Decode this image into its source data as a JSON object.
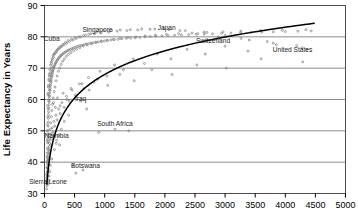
{
  "chart_data": {
    "type": "scatter",
    "title": "",
    "xlabel": "",
    "ylabel": "Life Expectancy in Years",
    "xlim": [
      0,
      5000
    ],
    "ylim": [
      30,
      90
    ],
    "xticks": [
      0,
      500,
      1000,
      1500,
      2000,
      2500,
      3000,
      3500,
      4000,
      4500,
      5000
    ],
    "yticks": [
      30,
      40,
      50,
      60,
      70,
      80,
      90
    ],
    "xtick_labels": [
      "0",
      "500",
      "1000",
      "1500",
      "2000",
      "2500",
      "3000",
      "3500",
      "4000",
      "4500",
      "5000"
    ],
    "ytick_labels": [
      "30",
      "40",
      "50",
      "60",
      "70",
      "80",
      "90"
    ],
    "grid": "horizontal",
    "legend": "none",
    "marker": "open-circle",
    "marker_color": "#808080",
    "trendline": {
      "present": true,
      "shape": "logarithmic",
      "color": "#000000",
      "x_start": 40,
      "x_end": 4480,
      "y_start": 33,
      "y_end": 84.3
    },
    "annotations": [
      {
        "text": "Singapore",
        "x": 880,
        "y": 81.5
      },
      {
        "text": "Japan",
        "x": 2030,
        "y": 82.3
      },
      {
        "text": "Cuba",
        "x": 120,
        "y": 78.6
      },
      {
        "text": "Switzerland",
        "x": 2800,
        "y": 78.0
      },
      {
        "text": "United States",
        "x": 4120,
        "y": 75.2
      },
      {
        "text": "Iraq",
        "x": 600,
        "y": 59.6
      },
      {
        "text": "South Africa",
        "x": 1170,
        "y": 51.6
      },
      {
        "text": "Namibia",
        "x": 200,
        "y": 47.7
      },
      {
        "text": "Botswana",
        "x": 680,
        "y": 38.0
      },
      {
        "text": "Sierra Leone",
        "x": 60,
        "y": 33.1
      }
    ],
    "points": [
      [
        35,
        33.2
      ],
      [
        38,
        35.0
      ],
      [
        40,
        36.3
      ],
      [
        42,
        38.2
      ],
      [
        44,
        40.1
      ],
      [
        46,
        41.5
      ],
      [
        48,
        43.0
      ],
      [
        50,
        44.6
      ],
      [
        52,
        46.2
      ],
      [
        55,
        47.5
      ],
      [
        58,
        48.8
      ],
      [
        60,
        50.2
      ],
      [
        62,
        51.5
      ],
      [
        64,
        52.8
      ],
      [
        66,
        54.0
      ],
      [
        68,
        55.2
      ],
      [
        70,
        56.1
      ],
      [
        72,
        57.3
      ],
      [
        75,
        58.4
      ],
      [
        78,
        59.4
      ],
      [
        80,
        60.3
      ],
      [
        83,
        61.2
      ],
      [
        86,
        62.0
      ],
      [
        90,
        62.9
      ],
      [
        94,
        63.6
      ],
      [
        98,
        64.4
      ],
      [
        102,
        65.1
      ],
      [
        106,
        65.7
      ],
      [
        110,
        66.4
      ],
      [
        115,
        67.0
      ],
      [
        120,
        67.6
      ],
      [
        126,
        68.1
      ],
      [
        132,
        68.6
      ],
      [
        138,
        69.1
      ],
      [
        145,
        69.6
      ],
      [
        152,
        70.0
      ],
      [
        160,
        70.5
      ],
      [
        168,
        70.9
      ],
      [
        176,
        71.3
      ],
      [
        185,
        71.7
      ],
      [
        195,
        72.0
      ],
      [
        205,
        72.4
      ],
      [
        216,
        72.7
      ],
      [
        228,
        73.0
      ],
      [
        240,
        73.3
      ],
      [
        253,
        73.6
      ],
      [
        267,
        73.9
      ],
      [
        282,
        74.2
      ],
      [
        297,
        74.4
      ],
      [
        313,
        74.7
      ],
      [
        330,
        74.9
      ],
      [
        348,
        75.2
      ],
      [
        367,
        75.4
      ],
      [
        387,
        75.6
      ],
      [
        408,
        75.8
      ],
      [
        430,
        76.0
      ],
      [
        453,
        76.2
      ],
      [
        478,
        76.4
      ],
      [
        504,
        76.6
      ],
      [
        531,
        76.8
      ],
      [
        560,
        77.0
      ],
      [
        590,
        77.2
      ],
      [
        622,
        77.3
      ],
      [
        655,
        77.5
      ],
      [
        690,
        77.7
      ],
      [
        727,
        77.8
      ],
      [
        766,
        78.0
      ],
      [
        807,
        78.1
      ],
      [
        850,
        78.3
      ],
      [
        895,
        78.4
      ],
      [
        943,
        78.6
      ],
      [
        993,
        78.7
      ],
      [
        1046,
        78.8
      ],
      [
        1102,
        79.0
      ],
      [
        1161,
        79.1
      ],
      [
        1223,
        79.2
      ],
      [
        1288,
        79.4
      ],
      [
        1357,
        79.5
      ],
      [
        1429,
        79.6
      ],
      [
        1505,
        79.7
      ],
      [
        1585,
        79.8
      ],
      [
        1669,
        80.0
      ],
      [
        1758,
        80.1
      ],
      [
        1851,
        80.2
      ],
      [
        1949,
        80.3
      ],
      [
        2052,
        80.4
      ],
      [
        2161,
        80.5
      ],
      [
        2275,
        80.6
      ],
      [
        2395,
        80.7
      ],
      [
        2521,
        80.8
      ],
      [
        2654,
        80.9
      ],
      [
        2794,
        81.0
      ],
      [
        2941,
        81.1
      ],
      [
        3096,
        81.2
      ],
      [
        3259,
        81.3
      ],
      [
        3430,
        81.4
      ],
      [
        3610,
        81.5
      ],
      [
        3800,
        81.6
      ],
      [
        4000,
        81.7
      ],
      [
        4210,
        81.8
      ],
      [
        4430,
        81.9
      ],
      [
        45,
        42.0
      ],
      [
        52,
        40.5
      ],
      [
        58,
        44.0
      ],
      [
        63,
        46.5
      ],
      [
        70,
        49.0
      ],
      [
        48,
        52.0
      ],
      [
        55,
        54.5
      ],
      [
        62,
        57.0
      ],
      [
        70,
        59.5
      ],
      [
        78,
        61.0
      ],
      [
        85,
        63.0
      ],
      [
        95,
        64.5
      ],
      [
        105,
        66.0
      ],
      [
        118,
        67.5
      ],
      [
        130,
        69.0
      ],
      [
        145,
        70.5
      ],
      [
        40,
        47.0
      ],
      [
        44,
        50.0
      ],
      [
        50,
        58.0
      ],
      [
        56,
        61.5
      ],
      [
        64,
        64.0
      ],
      [
        72,
        66.5
      ],
      [
        80,
        68.0
      ],
      [
        90,
        69.5
      ],
      [
        100,
        71.0
      ],
      [
        112,
        72.0
      ],
      [
        125,
        73.0
      ],
      [
        140,
        74.0
      ],
      [
        158,
        74.5
      ],
      [
        178,
        75.0
      ],
      [
        200,
        75.5
      ],
      [
        225,
        76.0
      ],
      [
        255,
        76.5
      ],
      [
        288,
        77.0
      ],
      [
        325,
        77.5
      ],
      [
        368,
        78.0
      ],
      [
        416,
        78.5
      ],
      [
        470,
        79.0
      ],
      [
        530,
        79.5
      ],
      [
        600,
        80.0
      ],
      [
        680,
        80.5
      ],
      [
        770,
        81.0
      ],
      [
        870,
        81.5
      ],
      [
        985,
        82.0
      ],
      [
        1115,
        82.0
      ],
      [
        1260,
        82.2
      ],
      [
        1425,
        82.3
      ],
      [
        1615,
        82.5
      ],
      [
        1830,
        82.5
      ],
      [
        2070,
        82.3
      ],
      [
        2340,
        82.0
      ],
      [
        2650,
        81.5
      ],
      [
        3000,
        80.5
      ],
      [
        3400,
        79.0
      ],
      [
        3850,
        77.5
      ],
      [
        4360,
        76.0
      ],
      [
        38,
        36.0
      ],
      [
        42,
        34.5
      ],
      [
        46,
        38.5
      ],
      [
        50,
        36.8
      ],
      [
        54,
        39.5
      ],
      [
        58,
        37.5
      ],
      [
        62,
        41.0
      ],
      [
        66,
        39.0
      ],
      [
        70,
        43.0
      ],
      [
        74,
        41.5
      ],
      [
        80,
        45.0
      ],
      [
        86,
        43.5
      ],
      [
        92,
        47.0
      ],
      [
        100,
        45.5
      ],
      [
        108,
        49.0
      ],
      [
        118,
        47.5
      ],
      [
        128,
        51.0
      ],
      [
        140,
        49.5
      ],
      [
        155,
        53.0
      ],
      [
        170,
        51.5
      ],
      [
        190,
        55.0
      ],
      [
        210,
        53.5
      ],
      [
        235,
        57.0
      ],
      [
        260,
        55.5
      ],
      [
        290,
        59.0
      ],
      [
        325,
        57.5
      ],
      [
        365,
        61.0
      ],
      [
        410,
        59.5
      ],
      [
        460,
        63.0
      ],
      [
        515,
        61.5
      ],
      [
        580,
        65.0
      ],
      [
        650,
        63.5
      ],
      [
        730,
        67.0
      ],
      [
        820,
        65.5
      ],
      [
        920,
        69.0
      ],
      [
        1035,
        67.5
      ],
      [
        1165,
        71.0
      ],
      [
        1310,
        69.5
      ],
      [
        1475,
        73.0
      ],
      [
        1660,
        71.5
      ],
      [
        1870,
        74.5
      ],
      [
        2100,
        73.0
      ],
      [
        2370,
        76.0
      ],
      [
        2670,
        74.5
      ],
      [
        3000,
        77.0
      ],
      [
        3380,
        75.5
      ],
      [
        3800,
        78.0
      ],
      [
        4280,
        76.5
      ],
      [
        60,
        62.0
      ],
      [
        66,
        64.5
      ],
      [
        74,
        66.0
      ],
      [
        82,
        67.5
      ],
      [
        92,
        68.5
      ],
      [
        104,
        70.0
      ],
      [
        116,
        71.5
      ],
      [
        130,
        72.5
      ],
      [
        148,
        73.5
      ],
      [
        166,
        74.5
      ],
      [
        188,
        75.0
      ],
      [
        212,
        75.8
      ],
      [
        240,
        76.5
      ],
      [
        272,
        77.0
      ],
      [
        308,
        77.6
      ],
      [
        348,
        78.2
      ],
      [
        394,
        78.8
      ],
      [
        446,
        79.2
      ],
      [
        505,
        79.6
      ],
      [
        572,
        80.0
      ],
      [
        648,
        80.4
      ],
      [
        734,
        80.8
      ],
      [
        831,
        81.0
      ],
      [
        941,
        81.3
      ],
      [
        1066,
        81.5
      ],
      [
        1207,
        81.8
      ],
      [
        1367,
        82.0
      ],
      [
        1548,
        82.2
      ],
      [
        1753,
        82.4
      ],
      [
        1985,
        82.6
      ],
      [
        2248,
        82.0
      ],
      [
        2546,
        81.0
      ],
      [
        2884,
        80.0
      ],
      [
        3266,
        79.5
      ],
      [
        3700,
        78.5
      ],
      [
        4190,
        77.2
      ],
      [
        36,
        31.5
      ],
      [
        40,
        32.5
      ],
      [
        44,
        33.5
      ],
      [
        48,
        35.5
      ],
      [
        53,
        37.0
      ],
      [
        57,
        38.0
      ],
      [
        61,
        39.5
      ],
      [
        65,
        40.5
      ],
      [
        70,
        42.5
      ],
      [
        76,
        44.0
      ],
      [
        82,
        46.0
      ],
      [
        89,
        48.0
      ],
      [
        96,
        50.5
      ],
      [
        104,
        52.5
      ],
      [
        113,
        54.5
      ],
      [
        123,
        56.5
      ],
      [
        134,
        58.5
      ],
      [
        146,
        60.5
      ],
      [
        160,
        62.5
      ],
      [
        175,
        64.0
      ],
      [
        192,
        66.0
      ],
      [
        210,
        67.5
      ],
      [
        230,
        69.0
      ],
      [
        252,
        70.0
      ],
      [
        276,
        71.2
      ],
      [
        303,
        72.2
      ],
      [
        332,
        73.0
      ],
      [
        364,
        73.8
      ],
      [
        400,
        74.4
      ],
      [
        440,
        75.0
      ],
      [
        484,
        75.6
      ],
      [
        532,
        76.0
      ],
      [
        585,
        76.5
      ],
      [
        644,
        77.0
      ],
      [
        708,
        77.4
      ],
      [
        780,
        77.8
      ],
      [
        858,
        78.2
      ],
      [
        944,
        78.5
      ],
      [
        1038,
        78.9
      ],
      [
        1142,
        79.2
      ],
      [
        1257,
        79.5
      ],
      [
        1383,
        79.8
      ],
      [
        1521,
        80.0
      ],
      [
        1673,
        80.3
      ],
      [
        1841,
        80.5
      ],
      [
        2025,
        80.8
      ],
      [
        2228,
        81.0
      ],
      [
        2451,
        81.2
      ],
      [
        2696,
        81.4
      ],
      [
        2966,
        81.6
      ],
      [
        3263,
        81.8
      ],
      [
        3589,
        82.0
      ],
      [
        3948,
        82.1
      ],
      [
        4343,
        82.3
      ],
      [
        150,
        59.0
      ],
      [
        180,
        57.5
      ],
      [
        215,
        60.5
      ],
      [
        260,
        58.0
      ],
      [
        310,
        62.0
      ],
      [
        370,
        60.0
      ],
      [
        440,
        63.5
      ],
      [
        520,
        61.0
      ],
      [
        620,
        65.0
      ],
      [
        740,
        63.0
      ],
      [
        880,
        66.5
      ],
      [
        1050,
        64.5
      ],
      [
        1250,
        68.0
      ],
      [
        1490,
        66.0
      ],
      [
        1780,
        69.5
      ],
      [
        2120,
        68.0
      ],
      [
        2530,
        71.0
      ],
      [
        3020,
        70.0
      ],
      [
        3600,
        73.0
      ],
      [
        4290,
        72.0
      ],
      [
        600,
        59.5
      ],
      [
        700,
        57.0
      ],
      [
        400,
        55.0
      ],
      [
        330,
        53.0
      ],
      [
        280,
        50.5
      ],
      [
        230,
        48.5
      ],
      [
        195,
        46.0
      ],
      [
        165,
        44.0
      ],
      [
        1170,
        50.5
      ],
      [
        900,
        49.5
      ],
      [
        1400,
        50.0
      ],
      [
        640,
        37.5
      ],
      [
        470,
        39.0
      ],
      [
        520,
        36.5
      ],
      [
        200,
        47.0
      ],
      [
        160,
        48.5
      ],
      [
        250,
        45.5
      ],
      [
        120,
        41.0
      ],
      [
        95,
        39.0
      ],
      [
        88,
        37.0
      ],
      [
        75,
        35.5
      ],
      [
        68,
        34.0
      ],
      [
        60,
        33.0
      ]
    ]
  },
  "axis": {
    "y_title": "Life Expectancy in Years"
  }
}
